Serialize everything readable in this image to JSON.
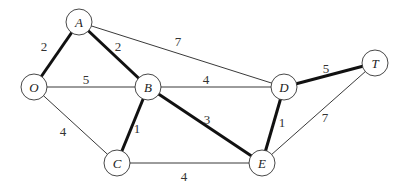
{
  "graph": {
    "nodes": [
      {
        "id": "A",
        "label": "A",
        "x": 79,
        "y": 22
      },
      {
        "id": "O",
        "label": "O",
        "x": 34,
        "y": 87
      },
      {
        "id": "B",
        "label": "B",
        "x": 148,
        "y": 87
      },
      {
        "id": "D",
        "label": "D",
        "x": 284,
        "y": 87
      },
      {
        "id": "T",
        "label": "T",
        "x": 375,
        "y": 63
      },
      {
        "id": "C",
        "label": "C",
        "x": 117,
        "y": 163
      },
      {
        "id": "E",
        "label": "E",
        "x": 262,
        "y": 163
      }
    ],
    "edges": [
      {
        "from": "O",
        "to": "A",
        "weight": "2",
        "bold": true,
        "lx": 44,
        "ly": 51
      },
      {
        "from": "A",
        "to": "B",
        "weight": "2",
        "bold": true,
        "lx": 118,
        "ly": 51
      },
      {
        "from": "A",
        "to": "D",
        "weight": "7",
        "bold": false,
        "lx": 178,
        "ly": 46
      },
      {
        "from": "O",
        "to": "B",
        "weight": "5",
        "bold": false,
        "lx": 86,
        "ly": 84
      },
      {
        "from": "B",
        "to": "D",
        "weight": "4",
        "bold": false,
        "lx": 206,
        "ly": 84
      },
      {
        "from": "D",
        "to": "T",
        "weight": "5",
        "bold": true,
        "lx": 326,
        "ly": 73
      },
      {
        "from": "O",
        "to": "C",
        "weight": "4",
        "bold": false,
        "lx": 63,
        "ly": 136
      },
      {
        "from": "B",
        "to": "C",
        "weight": "1",
        "bold": true,
        "lx": 137,
        "ly": 133
      },
      {
        "from": "B",
        "to": "E",
        "weight": "3",
        "bold": true,
        "lx": 207,
        "ly": 124
      },
      {
        "from": "D",
        "to": "E",
        "weight": "1",
        "bold": true,
        "lx": 282,
        "ly": 127
      },
      {
        "from": "E",
        "to": "T",
        "weight": "7",
        "bold": false,
        "lx": 325,
        "ly": 122
      },
      {
        "from": "C",
        "to": "E",
        "weight": "4",
        "bold": false,
        "lx": 184,
        "ly": 181
      }
    ],
    "node_radius": 13
  }
}
